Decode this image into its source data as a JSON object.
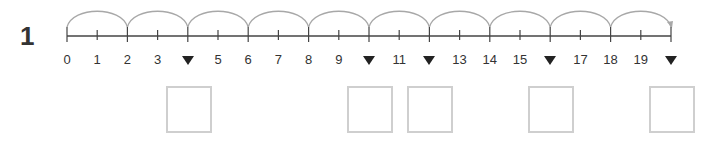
{
  "question": {
    "number": "1"
  },
  "number_line": {
    "min": 0,
    "max": 20,
    "origin_x": 67,
    "unit_px": 30.2,
    "line_y": 36,
    "jump_size": 2,
    "labels": [
      "0",
      "1",
      "2",
      "3",
      "",
      "5",
      "6",
      "7",
      "8",
      "9",
      "",
      "11",
      "",
      "13",
      "14",
      "15",
      "",
      "17",
      "18",
      "19",
      ""
    ],
    "hidden_positions": [
      4,
      10,
      12,
      16,
      20
    ],
    "hidden_marker": "down-triangle",
    "colors": {
      "line": "#444444",
      "arc": "#a8a8a8",
      "marker": "#222222",
      "box_border": "#cfcfcf"
    }
  },
  "answer_boxes": [
    {
      "position": 4,
      "value": ""
    },
    {
      "position": 10,
      "value": ""
    },
    {
      "position": 12,
      "value": ""
    },
    {
      "position": 16,
      "value": ""
    },
    {
      "position": 20,
      "value": ""
    }
  ]
}
